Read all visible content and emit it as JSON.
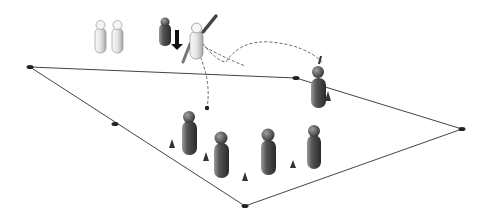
{
  "diagram": {
    "field": {
      "corners": [
        [
          30,
          67
        ],
        [
          296,
          78
        ],
        [
          462,
          129
        ],
        [
          245,
          206
        ]
      ],
      "edge_markers": [
        [
          30,
          67
        ],
        [
          115,
          124
        ],
        [
          296,
          78
        ],
        [
          462,
          129
        ],
        [
          245,
          206
        ]
      ],
      "line_color": "#444444",
      "marker_color": "#222222"
    },
    "batting_area": {
      "waiting_batters": [
        [
          100,
          22
        ],
        [
          118,
          22
        ]
      ],
      "wicketkeeper": [
        165,
        26
      ],
      "batter": [
        198,
        30
      ],
      "stumps": [
        177,
        38
      ],
      "ball_landing_dot": [
        207,
        108
      ]
    },
    "bowler": [
      318,
      78
    ],
    "fielders": [
      [
        189,
        126
      ],
      [
        221,
        150
      ],
      [
        268,
        147
      ],
      [
        314,
        142
      ]
    ],
    "cones": [
      [
        172,
        144
      ],
      [
        206,
        157
      ],
      [
        245,
        178
      ],
      [
        293,
        165
      ],
      [
        328,
        96
      ]
    ],
    "colors": {
      "light_figure": "#e6e6e6",
      "dark_figure": "#555555",
      "cone": "#333333",
      "path": "#666666"
    }
  }
}
